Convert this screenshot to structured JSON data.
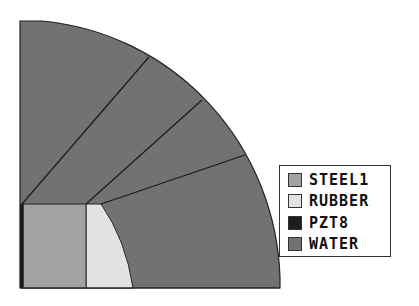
{
  "diagram": {
    "type": "quarter-circle-mesh",
    "colors": {
      "water": "#727272",
      "steel1": "#a3a3a3",
      "rubber": "#e2e2e2",
      "pzt8": "#1c1c1c",
      "outline": "#222222"
    }
  },
  "legend": {
    "items": [
      {
        "label": "STEEL1",
        "color": "#a3a3a3"
      },
      {
        "label": "RUBBER",
        "color": "#e2e2e2"
      },
      {
        "label": "PZT8",
        "color": "#1c1c1c"
      },
      {
        "label": "WATER",
        "color": "#727272"
      }
    ]
  }
}
